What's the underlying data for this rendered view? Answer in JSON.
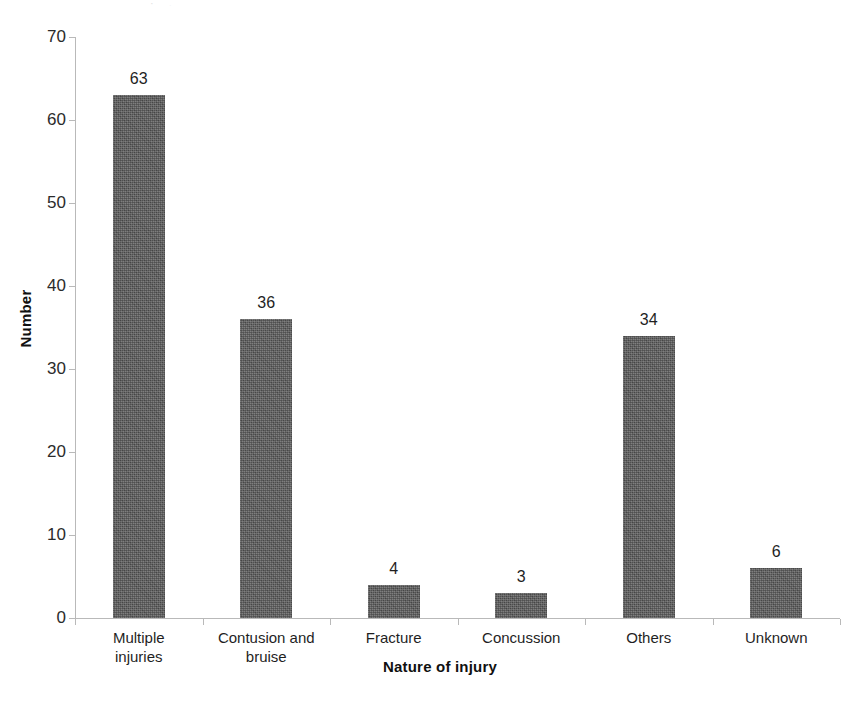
{
  "page": {
    "background_color": "#ffffff",
    "bleed_artifact_text": "· ,"
  },
  "chart_data": {
    "type": "bar",
    "title": "",
    "subtitle": "",
    "xlabel": "Nature of injury",
    "ylabel": "Number",
    "categories": [
      "Multiple\ninjuries",
      "Contusion and\nbruise",
      "Fracture",
      "Concussion",
      "Others",
      "Unknown"
    ],
    "values": [
      63,
      36,
      4,
      3,
      34,
      6
    ],
    "value_labels": [
      "63",
      "36",
      "4",
      "3",
      "34",
      "6"
    ],
    "ylim": [
      0,
      70
    ],
    "ytick_values": [
      0,
      10,
      20,
      30,
      40,
      50,
      60,
      70
    ],
    "ytick_labels": [
      "0",
      "10",
      "20",
      "30",
      "40",
      "50",
      "60",
      "70"
    ],
    "grid": false,
    "legend": null,
    "bar_color": "#5a5a5a",
    "axis_color": "#b9b9b9",
    "text_color": "#1f1f1f",
    "orientation": "vertical",
    "bar_width_px": 52,
    "value_labels_shown": true
  }
}
